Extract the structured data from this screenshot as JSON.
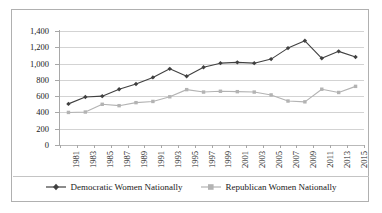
{
  "chart_data": {
    "type": "line",
    "title": "",
    "xlabel": "",
    "ylabel": "",
    "ylim": [
      0,
      1400
    ],
    "ytick_step": 200,
    "grid": true,
    "legend_position": "bottom",
    "categories": [
      "1981",
      "1983",
      "1985",
      "1987",
      "1989",
      "1991",
      "1993",
      "1995",
      "1997",
      "1999",
      "2001",
      "2003",
      "2005",
      "2007",
      "2009",
      "2011",
      "2013",
      "2015"
    ],
    "ytick_labels": [
      "0",
      "200",
      "400",
      "600",
      "800",
      "1,000",
      "1,200",
      "1,400"
    ],
    "ytick_values": [
      0,
      200,
      400,
      600,
      800,
      1000,
      1200,
      1400
    ],
    "series": [
      {
        "name": "Democratic Women Nationally",
        "color": "#404040",
        "marker": "diamond",
        "values": [
          505,
          590,
          600,
          685,
          750,
          830,
          935,
          845,
          955,
          1005,
          1015,
          1005,
          1055,
          1190,
          1280,
          1065,
          1150,
          1080
        ]
      },
      {
        "name": "Republican Women Nationally",
        "color": "#b3b3b3",
        "marker": "square",
        "values": [
          400,
          405,
          500,
          483,
          520,
          535,
          592,
          680,
          650,
          660,
          655,
          650,
          615,
          540,
          530,
          685,
          645,
          720
        ]
      }
    ]
  },
  "legend": {
    "entries": [
      {
        "label": "Democratic Women Nationally"
      },
      {
        "label": "Republican Women Nationally"
      }
    ]
  },
  "colors": {
    "democratic": "#404040",
    "republican": "#b3b3b3",
    "gridline": "#d3d3d3",
    "axis": "#a8a8a8",
    "border": "#b0b0b0",
    "background": "#ffffff"
  }
}
